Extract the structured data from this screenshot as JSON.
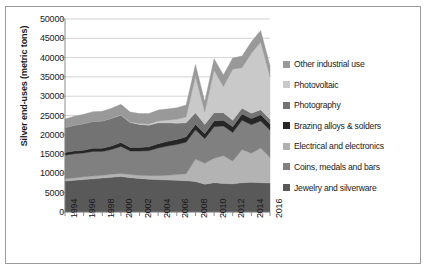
{
  "chart_data": {
    "type": "area",
    "stacked": true,
    "title": "",
    "xlabel": "",
    "ylabel": "Silver end-uses (metric tons)",
    "ylim": [
      0,
      50000
    ],
    "ytick_values": [
      0,
      5000,
      10000,
      15000,
      20000,
      25000,
      30000,
      35000,
      40000,
      45000,
      50000
    ],
    "ytick_labels": [
      "0",
      "5000",
      "10000",
      "15000",
      "20000",
      "25000",
      "30000",
      "35000",
      "40000",
      "45000",
      "50000"
    ],
    "grid": true,
    "grid_axis": "y",
    "legend_position": "right",
    "x": [
      1994,
      1995,
      1996,
      1997,
      1998,
      1999,
      2000,
      2001,
      2002,
      2003,
      2004,
      2005,
      2006,
      2007,
      2008,
      2009,
      2010,
      2011,
      2012,
      2013,
      2014,
      2015,
      2016
    ],
    "xtick_labels": [
      "1994",
      "1996",
      "1998",
      "2000",
      "2002",
      "2004",
      "2006",
      "2008",
      "2010",
      "2012",
      "2014",
      "2016"
    ],
    "series": [
      {
        "name": "Jewelry and silverware",
        "color": "#595959",
        "values": [
          8000,
          8200,
          8400,
          8600,
          8800,
          9000,
          9200,
          8900,
          8700,
          8500,
          8400,
          8300,
          8200,
          8100,
          7900,
          7200,
          7600,
          7400,
          7300,
          7600,
          7700,
          7600,
          7500
        ]
      },
      {
        "name": "Coins, medals and bars",
        "color": "#b3b3b3",
        "values": [
          600,
          600,
          700,
          700,
          700,
          800,
          800,
          800,
          800,
          900,
          1000,
          1200,
          1500,
          1800,
          5800,
          5400,
          6300,
          7200,
          5900,
          8600,
          7500,
          9000,
          6600
        ]
      },
      {
        "name": "Electrical and electronics",
        "color": "#808080",
        "values": [
          6100,
          6300,
          6200,
          6400,
          6200,
          6400,
          7000,
          6100,
          6300,
          6500,
          7200,
          7600,
          7800,
          8200,
          7600,
          6400,
          8200,
          7700,
          7400,
          7600,
          7400,
          7000,
          7100
        ]
      },
      {
        "name": "Brazing alloys & solders",
        "color": "#262626",
        "values": [
          700,
          700,
          700,
          800,
          800,
          900,
          1000,
          900,
          900,
          1000,
          1100,
          1200,
          1300,
          1400,
          1400,
          1300,
          1500,
          1500,
          1500,
          1600,
          1600,
          1600,
          1600
        ]
      },
      {
        "name": "Photography",
        "color": "#737373",
        "values": [
          6500,
          6700,
          6900,
          7000,
          7100,
          7200,
          7100,
          6500,
          6000,
          5600,
          5400,
          4800,
          4200,
          3600,
          3000,
          2400,
          2100,
          1900,
          1700,
          1500,
          1400,
          1300,
          1200
        ]
      },
      {
        "name": "Photovoltaic",
        "color": "#c9c9c9",
        "values": [
          0,
          0,
          0,
          0,
          0,
          0,
          100,
          100,
          200,
          300,
          500,
          700,
          1000,
          1500,
          9500,
          3200,
          11000,
          6800,
          13200,
          10500,
          15500,
          17500,
          11000
        ]
      },
      {
        "name": "Other industrial use",
        "color": "#999999",
        "values": [
          2200,
          2300,
          2400,
          2500,
          2500,
          2600,
          2700,
          2600,
          2600,
          2700,
          2800,
          2900,
          3000,
          3100,
          3000,
          2700,
          3000,
          3000,
          2900,
          3000,
          3000,
          3000,
          2900
        ]
      }
    ]
  },
  "legend": {
    "items": [
      {
        "label": "Other industrial use",
        "color": "#999999"
      },
      {
        "label": "Photovoltaic",
        "color": "#c9c9c9"
      },
      {
        "label": "Photography",
        "color": "#737373"
      },
      {
        "label": "Brazing alloys & solders",
        "color": "#262626"
      },
      {
        "label": "Electrical and electronics",
        "color": "#b0b0b0"
      },
      {
        "label": "Coins, medals and bars",
        "color": "#808080"
      },
      {
        "label": "Jewelry and silverware",
        "color": "#595959"
      }
    ]
  }
}
